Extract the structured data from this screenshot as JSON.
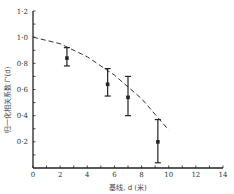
{
  "chart_data": {
    "type": "scatter",
    "title": "",
    "xlabel": "基线, d (米)",
    "ylabel": "归一化相关系数 Γ'(d)",
    "xlim": [
      0,
      14
    ],
    "ylim": [
      0,
      1.2
    ],
    "x_ticks": [
      "0",
      "2",
      "4",
      "6",
      "8",
      "10",
      "12",
      "14"
    ],
    "y_ticks": [
      "0·2",
      "0·4",
      "0·6",
      "0·8",
      "1·0",
      "1·2"
    ],
    "grid": false,
    "series": [
      {
        "name": "measured",
        "style": "points-with-errorbars",
        "points": [
          {
            "x": 2.5,
            "y": 0.84,
            "err_low": 0.78,
            "err_high": 0.92
          },
          {
            "x": 5.5,
            "y": 0.64,
            "err_low": 0.55,
            "err_high": 0.76
          },
          {
            "x": 7.0,
            "y": 0.54,
            "err_low": 0.4,
            "err_high": 0.7
          },
          {
            "x": 9.2,
            "y": 0.2,
            "err_low": 0.04,
            "err_high": 0.37
          }
        ]
      },
      {
        "name": "theoretical",
        "style": "dashed-line",
        "x": [
          0,
          2,
          4,
          6,
          8,
          10
        ],
        "y": [
          1.0,
          0.95,
          0.85,
          0.71,
          0.53,
          0.29
        ]
      }
    ]
  }
}
